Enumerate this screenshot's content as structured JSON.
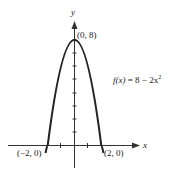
{
  "figure": {
    "axis_labels": {
      "x": "x",
      "y": "y"
    },
    "points": {
      "vertex": "(0, 8)",
      "left_intercept": "(−2, 0)",
      "right_intercept": "(2, 0)"
    },
    "equation": {
      "lhs": "f(x)",
      "eq": "=",
      "rhs": "8 − 2x",
      "exponent": "2"
    },
    "colors": {
      "line": "#222222",
      "background": "#ffffff"
    }
  }
}
